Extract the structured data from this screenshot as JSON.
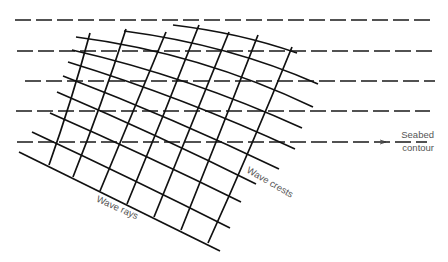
{
  "labels": {
    "seabed_line1": "Seabed",
    "seabed_line2": "contour",
    "wave_crests": "Wave crests",
    "wave_rays": "Wave rays"
  },
  "colors": {
    "line": "#111111",
    "label": "#555555",
    "background": "#ffffff"
  },
  "seabed_contours": [
    {
      "x1": 15,
      "x2": 430,
      "y": 20
    },
    {
      "x1": 17,
      "x2": 436,
      "y": 51
    },
    {
      "x1": 25,
      "x2": 435,
      "y": 81
    },
    {
      "x1": 16,
      "x2": 430,
      "y": 111
    },
    {
      "x1": 17,
      "x2": 427,
      "y": 142
    }
  ],
  "wave_crests": [
    {
      "x1": 173,
      "y1": 25,
      "cx": 240,
      "cy": 33,
      "x2": 297,
      "y2": 53
    },
    {
      "x1": 124,
      "y1": 31,
      "cx": 230,
      "cy": 45,
      "x2": 318,
      "y2": 84
    },
    {
      "x1": 76,
      "y1": 37,
      "cx": 200,
      "cy": 53,
      "x2": 313,
      "y2": 107
    },
    {
      "x1": 72,
      "y1": 50,
      "cx": 190,
      "cy": 77,
      "x2": 302,
      "y2": 128
    },
    {
      "x1": 68,
      "y1": 62,
      "cx": 185,
      "cy": 98,
      "x2": 295,
      "y2": 149
    },
    {
      "x1": 63,
      "y1": 76,
      "cx": 175,
      "cy": 119,
      "x2": 279,
      "y2": 169
    },
    {
      "x1": 57,
      "y1": 92,
      "cx": 160,
      "cy": 136,
      "x2": 256,
      "y2": 184
    },
    {
      "x1": 50,
      "y1": 113,
      "cx": 150,
      "cy": 157,
      "x2": 241,
      "y2": 202
    },
    {
      "x1": 32,
      "y1": 132,
      "cx": 135,
      "cy": 180,
      "x2": 230,
      "y2": 228
    },
    {
      "x1": 19,
      "y1": 152,
      "cx": 120,
      "cy": 202,
      "x2": 220,
      "y2": 251
    }
  ],
  "wave_rays": [
    {
      "x1": 90,
      "y1": 33,
      "cx": 72,
      "cy": 100,
      "x2": 49,
      "y2": 165
    },
    {
      "x1": 126,
      "y1": 29,
      "cx": 102,
      "cy": 104,
      "x2": 73,
      "y2": 177
    },
    {
      "x1": 166,
      "y1": 32,
      "cx": 134,
      "cy": 110,
      "x2": 100,
      "y2": 191
    },
    {
      "x1": 199,
      "y1": 25,
      "cx": 164,
      "cy": 115,
      "x2": 127,
      "y2": 204
    },
    {
      "x1": 229,
      "y1": 32,
      "cx": 192,
      "cy": 124,
      "x2": 154,
      "y2": 217
    },
    {
      "x1": 258,
      "y1": 35,
      "cx": 220,
      "cy": 133,
      "x2": 181,
      "y2": 230
    },
    {
      "x1": 292,
      "y1": 47,
      "cx": 252,
      "cy": 146,
      "x2": 208,
      "y2": 243
    }
  ]
}
